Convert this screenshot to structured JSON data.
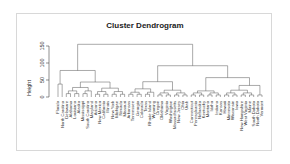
{
  "chart_data": {
    "type": "dendrogram",
    "title": "Cluster Dendrogram",
    "xlabel": "",
    "ylabel": "Height",
    "yticks": [
      0,
      50,
      100,
      150
    ],
    "ylim": [
      0,
      160
    ],
    "grid": false,
    "leaves": [
      "Florida",
      "North Carolina",
      "Delaware",
      "Alabama",
      "Louisiana",
      "Alaska",
      "Mississippi",
      "South Carolina",
      "Maryland",
      "Arizona",
      "New Mexico",
      "California",
      "Illinois",
      "New York",
      "Michigan",
      "Nevada",
      "Missouri",
      "Arkansas",
      "Tennessee",
      "Georgia",
      "Colorado",
      "Texas",
      "Rhode Island",
      "Wyoming",
      "Oregon",
      "Oklahoma",
      "Virginia",
      "Washington",
      "Massachusetts",
      "New Jersey",
      "Ohio",
      "Utah",
      "Connecticut",
      "Pennsylvania",
      "Nebraska",
      "Kentucky",
      "Montana",
      "Idaho",
      "Indiana",
      "Kansas",
      "Hawaii",
      "Minnesota",
      "Wisconsin",
      "Iowa",
      "New Hampshire",
      "West Virginia",
      "Maine",
      "South Dakota",
      "North Dakota",
      "Vermont"
    ],
    "merges": [
      {
        "height": 155,
        "label": "root"
      },
      {
        "height": 78,
        "label": "left cluster"
      },
      {
        "height": 92,
        "label": "right cluster"
      },
      {
        "height": 57,
        "label": "right-right cluster"
      },
      {
        "height": 45,
        "label": "right-left cluster"
      },
      {
        "height": 44,
        "label": "left-right cluster"
      },
      {
        "height": 38,
        "label": "Florida-North Carolina"
      }
    ]
  },
  "labels": {
    "title": "Cluster Dendrogram",
    "ylabel": "Height",
    "ticks": [
      "0",
      "50",
      "100",
      "150"
    ]
  }
}
